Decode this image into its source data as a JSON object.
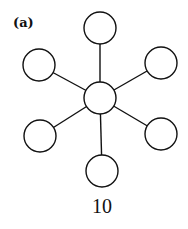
{
  "panel_label": "(a)",
  "caption": "10",
  "diagram": {
    "type": "star-graph",
    "center_node": {
      "x": 100,
      "y": 98,
      "r": 16
    },
    "leaf_nodes": [
      {
        "x": 100,
        "y": 28
      },
      {
        "x": 161,
        "y": 63
      },
      {
        "x": 161,
        "y": 134
      },
      {
        "x": 102,
        "y": 171
      },
      {
        "x": 40,
        "y": 136
      },
      {
        "x": 39,
        "y": 65
      }
    ],
    "node_radius": 16,
    "stroke_color": "#111111"
  }
}
